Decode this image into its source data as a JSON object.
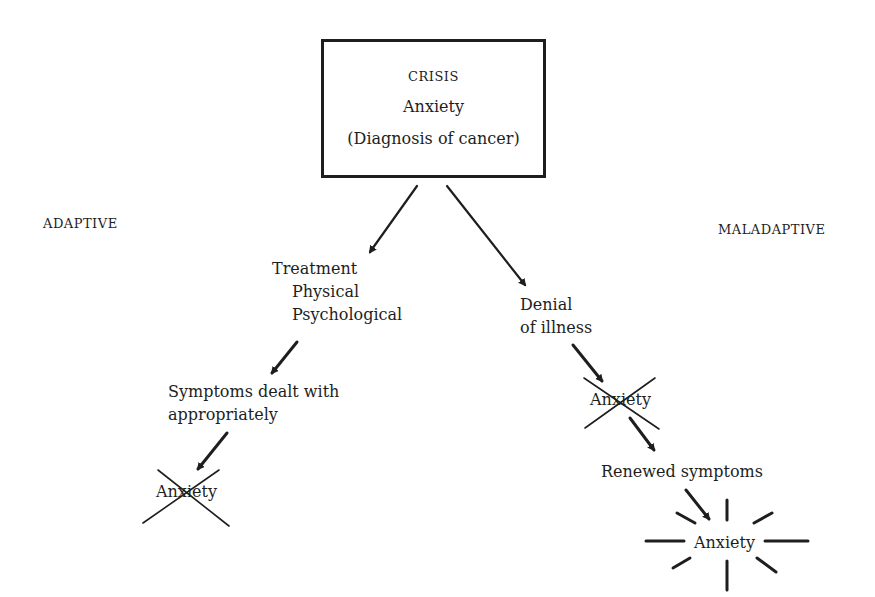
{
  "crisis_box": {
    "title": "CRISIS",
    "line2": "Anxiety",
    "line3": "(Diagnosis of cancer)"
  },
  "labels": {
    "adaptive": "ADAPTIVE",
    "maladaptive": "MALADAPTIVE"
  },
  "adaptive_path": {
    "treatment": "Treatment",
    "physical": "Physical",
    "psychological": "Psychological",
    "symptoms_line1": "Symptoms dealt with",
    "symptoms_line2": "appropriately",
    "anxiety_crossed": "Anxiety"
  },
  "maladaptive_path": {
    "denial_line1": "Denial",
    "denial_line2": "of illness",
    "anxiety_crossed": "Anxiety",
    "renewed": "Renewed symptoms",
    "anxiety_burst": "Anxiety"
  }
}
